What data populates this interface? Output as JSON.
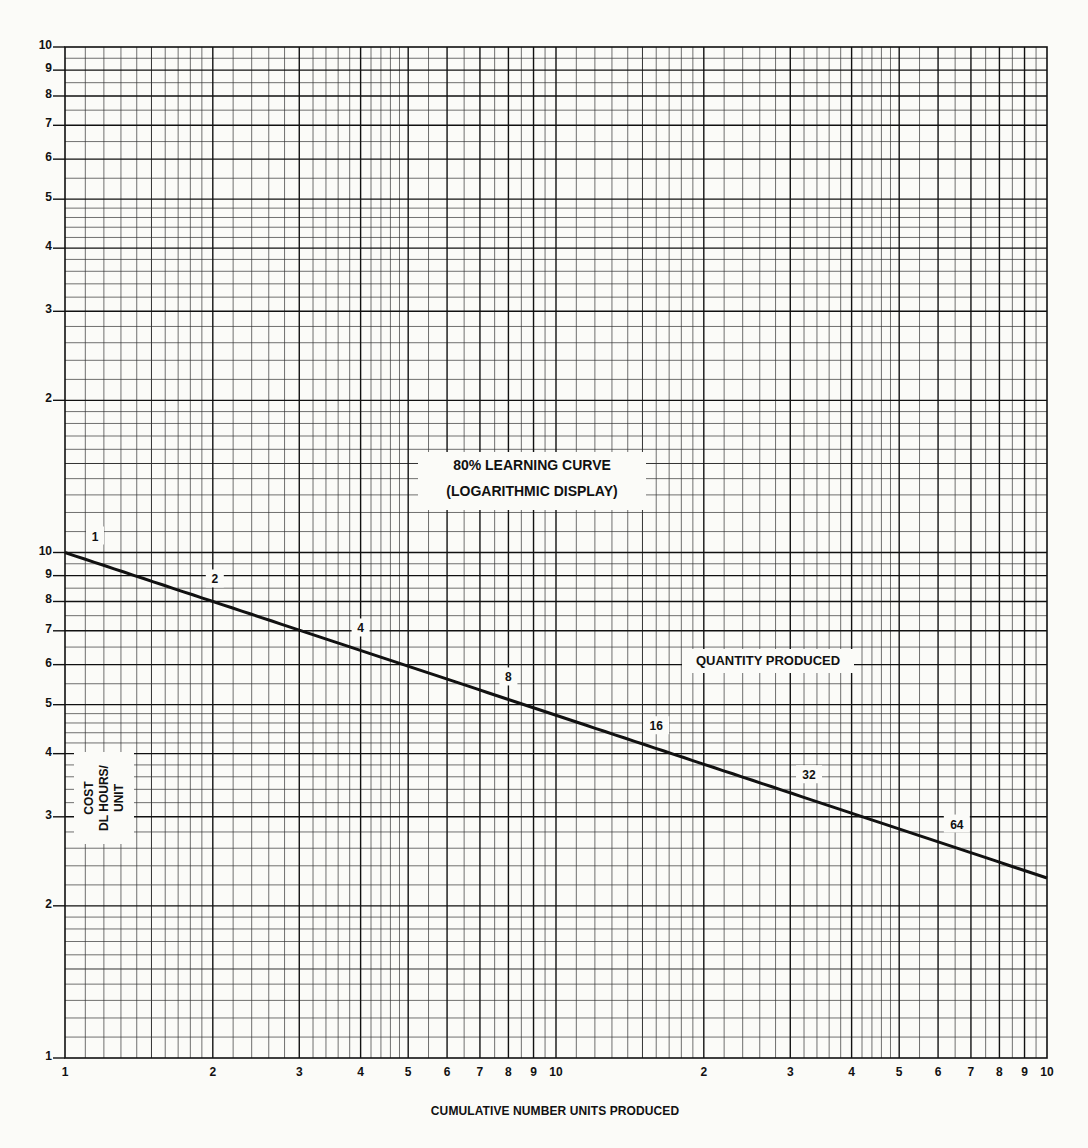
{
  "chart_data": {
    "type": "line",
    "title": "80% LEARNING CURVE",
    "subtitle": "(LOGARITHMIC DISPLAY)",
    "xlabel": "CUMULATIVE NUMBER UNITS PRODUCED",
    "ylabel": [
      "COST",
      "DL HOURS/",
      "UNIT"
    ],
    "annotations": [
      "QUANTITY PRODUCED"
    ],
    "x_scale": "log",
    "y_scale": "log",
    "xlim": [
      1,
      100
    ],
    "ylim": [
      1,
      100
    ],
    "grid": true,
    "x_tick_labels": [
      "1",
      "2",
      "3",
      "4",
      "5",
      "6",
      "7",
      "8",
      "9",
      "10",
      "2",
      "3",
      "4",
      "5",
      "6",
      "7",
      "8",
      "9",
      "10"
    ],
    "y_tick_labels_lower_decade": [
      "1",
      "2",
      "3",
      "4",
      "5",
      "6",
      "7",
      "8",
      "9",
      "10"
    ],
    "y_tick_labels_upper_decade": [
      "2",
      "3",
      "4",
      "5",
      "6",
      "7",
      "8",
      "9",
      "10"
    ],
    "learning_rate": 0.8,
    "series": [
      {
        "name": "80% learning curve",
        "x": [
          1,
          2,
          4,
          8,
          16,
          32,
          64,
          100
        ],
        "y": [
          10,
          8,
          6.4,
          5.12,
          4.1,
          3.28,
          2.62,
          2.27
        ]
      }
    ],
    "point_labels": [
      "1",
      "2",
      "4",
      "8",
      "16",
      "32",
      "64"
    ]
  }
}
